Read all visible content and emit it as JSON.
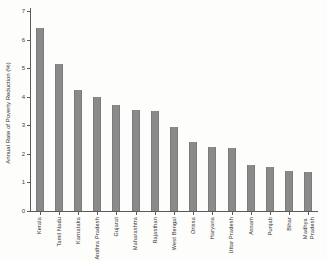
{
  "chart_data": {
    "type": "bar",
    "title": "",
    "xlabel": "",
    "ylabel": "Annual Rate of Poverty Reduction (%)",
    "ylim": [
      0,
      7
    ],
    "yticks": [
      0,
      1,
      2,
      3,
      4,
      5,
      6,
      7
    ],
    "grid": false,
    "legend": "none",
    "bar_color": "#8a8a8a",
    "categories": [
      "Kerala",
      "Tamil Nadu",
      "Karnataka",
      "Andhra Pradesh",
      "Gujarat",
      "Maharashtra",
      "Rajasthan",
      "West Bengal",
      "Orissa",
      "Haryana",
      "Uttar Pradesh",
      "Assam",
      "Punjab",
      "Bihar",
      "Madhya\nPradesh"
    ],
    "values": [
      6.4,
      5.15,
      4.25,
      4.0,
      3.7,
      3.55,
      3.5,
      2.95,
      2.4,
      2.25,
      2.2,
      1.6,
      1.55,
      1.4,
      1.35
    ]
  }
}
